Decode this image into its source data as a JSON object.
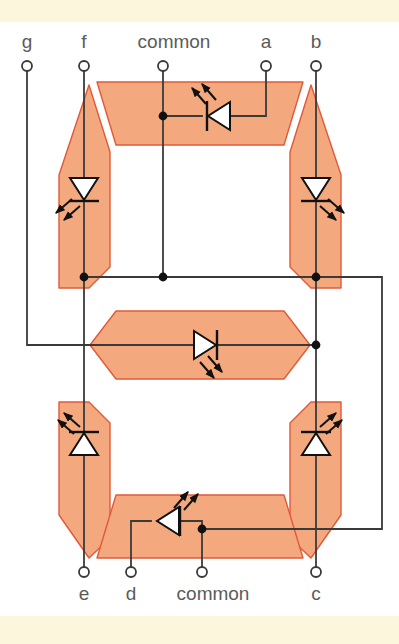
{
  "figure": {
    "background_color": "#ffffff",
    "band_color": "#fbf6dc"
  },
  "colors": {
    "segment_fill": "#f3a97d",
    "segment_stroke": "#e2593a",
    "wire": "#3a3a3a",
    "label_text": "#5b5b5b",
    "node_dot": "#111111",
    "led_body_fill": "#ffffff",
    "led_outline": "#111111"
  },
  "terminals": {
    "top": [
      {
        "id": "g",
        "label": "g",
        "x": 27,
        "label_x": 27,
        "label_y": 48,
        "node_y": 66
      },
      {
        "id": "f",
        "label": "f",
        "x": 84,
        "label_x": 84,
        "label_y": 48,
        "node_y": 66
      },
      {
        "id": "common_top",
        "label": "common",
        "x": 163,
        "label_x": 174,
        "label_y": 48,
        "node_y": 66
      },
      {
        "id": "a",
        "label": "a",
        "x": 266,
        "label_x": 266,
        "label_y": 48,
        "node_y": 66
      },
      {
        "id": "b",
        "label": "b",
        "x": 316,
        "label_x": 316,
        "label_y": 48,
        "node_y": 66
      }
    ],
    "bottom": [
      {
        "id": "e",
        "label": "e",
        "x": 84,
        "label_x": 84,
        "label_y": 600,
        "node_y": 572
      },
      {
        "id": "d",
        "label": "d",
        "x": 131,
        "label_x": 131,
        "label_y": 600,
        "node_y": 572
      },
      {
        "id": "common_bottom",
        "label": "common",
        "x": 202,
        "label_x": 213,
        "label_y": 600,
        "node_y": 572
      },
      {
        "id": "c",
        "label": "c",
        "x": 316,
        "label_x": 316,
        "label_y": 600,
        "node_y": 572
      }
    ]
  },
  "segments": [
    {
      "id": "a",
      "name": "segment-a-top",
      "orientation": "horizontal"
    },
    {
      "id": "b",
      "name": "segment-b-upper-right",
      "orientation": "vertical"
    },
    {
      "id": "c",
      "name": "segment-c-lower-right",
      "orientation": "vertical"
    },
    {
      "id": "d",
      "name": "segment-d-bottom",
      "orientation": "horizontal"
    },
    {
      "id": "e",
      "name": "segment-e-lower-left",
      "orientation": "vertical"
    },
    {
      "id": "f",
      "name": "segment-f-upper-left",
      "orientation": "vertical"
    },
    {
      "id": "g",
      "name": "segment-g-middle",
      "orientation": "horizontal"
    }
  ],
  "leds": [
    {
      "id": "led-a",
      "segment": "a",
      "x": 216,
      "y": 116,
      "direction": "left",
      "emit": "up-left"
    },
    {
      "id": "led-f",
      "segment": "f",
      "x": 84,
      "y": 190,
      "direction": "down",
      "emit": "down-left"
    },
    {
      "id": "led-b",
      "segment": "b",
      "x": 316,
      "y": 190,
      "direction": "down",
      "emit": "down-right"
    },
    {
      "id": "led-g",
      "segment": "g",
      "x": 203,
      "y": 345,
      "direction": "right",
      "emit": "down-right"
    },
    {
      "id": "led-e",
      "segment": "e",
      "x": 84,
      "y": 443,
      "direction": "up",
      "emit": "up-left"
    },
    {
      "id": "led-c",
      "segment": "c",
      "x": 316,
      "y": 443,
      "direction": "up",
      "emit": "up-right"
    },
    {
      "id": "led-d",
      "segment": "d",
      "x": 165,
      "y": 521,
      "direction": "left",
      "emit": "up-right"
    }
  ],
  "nodes": [
    {
      "id": "node-a-common",
      "x": 163,
      "y": 116
    },
    {
      "id": "node-f-bus",
      "x": 84,
      "y": 277
    },
    {
      "id": "node-common-bus",
      "x": 163,
      "y": 277
    },
    {
      "id": "node-b-bus",
      "x": 316,
      "y": 277
    },
    {
      "id": "node-g-right",
      "x": 316,
      "y": 345
    },
    {
      "id": "node-d-common",
      "x": 202,
      "y": 529
    }
  ],
  "bus": {
    "mid_y": 277,
    "g_turn_y": 345,
    "g_left_x": 27,
    "right_rail_x": 382,
    "bottom_rail_y": 529
  }
}
